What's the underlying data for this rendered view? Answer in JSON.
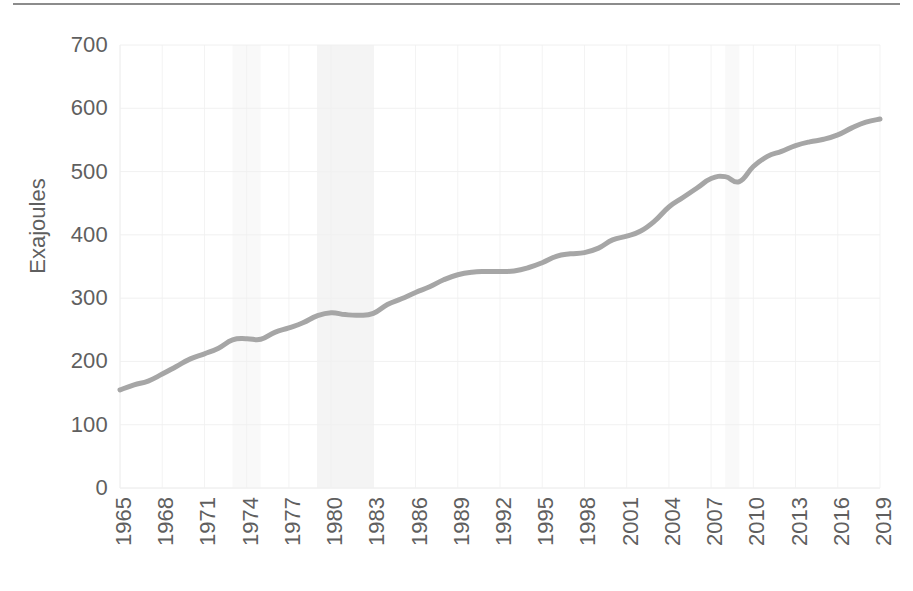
{
  "chart_data": {
    "type": "line",
    "title": "",
    "subtitle": "",
    "xlabel": "",
    "ylabel": "Exajoules",
    "ylim": [
      0,
      700
    ],
    "xlim": [
      1965,
      2019
    ],
    "y_ticks": [
      0,
      100,
      200,
      300,
      400,
      500,
      600,
      700
    ],
    "x_ticks": [
      1965,
      1968,
      1971,
      1974,
      1977,
      1980,
      1983,
      1986,
      1989,
      1992,
      1995,
      1998,
      2001,
      2004,
      2007,
      2010,
      2013,
      2016,
      2019
    ],
    "grid": "faint-both",
    "legend": "none",
    "line_color": "#A6A6A6",
    "line_width_px": 5,
    "shaded_band_color": "#F2F2F2",
    "shaded_bands": [
      {
        "start": 1973,
        "end": 1975,
        "opacity": "very-faint"
      },
      {
        "start": 1979,
        "end": 1983,
        "opacity": "faint"
      },
      {
        "start": 2008,
        "end": 2009,
        "opacity": "very-faint"
      }
    ],
    "x": [
      1965,
      1966,
      1967,
      1968,
      1969,
      1970,
      1971,
      1972,
      1973,
      1974,
      1975,
      1976,
      1977,
      1978,
      1979,
      1980,
      1981,
      1982,
      1983,
      1984,
      1985,
      1986,
      1987,
      1988,
      1989,
      1990,
      1991,
      1992,
      1993,
      1994,
      1995,
      1996,
      1997,
      1998,
      1999,
      2000,
      2001,
      2002,
      2003,
      2004,
      2005,
      2006,
      2007,
      2008,
      2009,
      2010,
      2011,
      2012,
      2013,
      2014,
      2015,
      2016,
      2017,
      2018,
      2019
    ],
    "values": [
      155,
      163,
      169,
      180,
      192,
      204,
      212,
      221,
      234,
      236,
      235,
      246,
      253,
      261,
      272,
      277,
      274,
      273,
      276,
      290,
      299,
      309,
      318,
      329,
      337,
      341,
      342,
      342,
      343,
      348,
      356,
      366,
      370,
      372,
      379,
      392,
      398,
      406,
      422,
      444,
      459,
      474,
      489,
      492,
      484,
      508,
      524,
      532,
      541,
      547,
      551,
      558,
      569,
      578,
      583
    ],
    "series": [
      {
        "name": "Global primary energy consumption",
        "values": [
          155,
          163,
          169,
          180,
          192,
          204,
          212,
          221,
          234,
          236,
          235,
          246,
          253,
          261,
          272,
          277,
          274,
          273,
          276,
          290,
          299,
          309,
          318,
          329,
          337,
          341,
          342,
          342,
          343,
          348,
          356,
          366,
          370,
          372,
          379,
          392,
          398,
          406,
          422,
          444,
          459,
          474,
          489,
          492,
          484,
          508,
          524,
          532,
          541,
          547,
          551,
          558,
          569,
          578,
          583
        ],
        "color": "#A6A6A6"
      }
    ]
  },
  "axes": {
    "y_title": "Exajoules",
    "y_labels": [
      "700",
      "600",
      "500",
      "400",
      "300",
      "200",
      "100",
      "0"
    ],
    "x_labels": [
      "1965",
      "1968",
      "1971",
      "1974",
      "1977",
      "1980",
      "1983",
      "1986",
      "1989",
      "1992",
      "1995",
      "1998",
      "2001",
      "2004",
      "2007",
      "2010",
      "2013",
      "2016",
      "2019"
    ]
  },
  "colors": {
    "line": "#A6A6A6",
    "tick_text": "#5f5f5f",
    "grid": "#F0F0F0",
    "band": "#F2F2F2",
    "top_rule": "#8c8c8c"
  }
}
